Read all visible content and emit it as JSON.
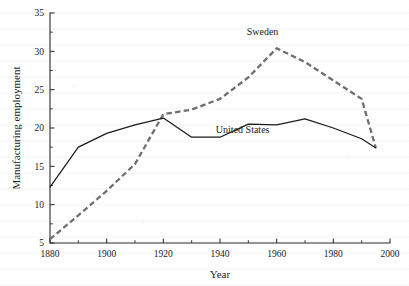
{
  "figure": {
    "name": "manufacturing-employment-line-chart",
    "background_color": "#fefefe"
  },
  "chart_data": {
    "type": "line",
    "title": "",
    "subtitle": "",
    "xlabel": "Year",
    "ylabel": "Manufacturing employment",
    "xlim": [
      1880,
      2000
    ],
    "ylim": [
      5,
      35
    ],
    "xticks": [
      1880,
      1900,
      1920,
      1940,
      1960,
      1980,
      2000
    ],
    "xticklabels": [
      "1880",
      "1900",
      "1920",
      "1940",
      "1960",
      "1980",
      "2000"
    ],
    "xticks_minor": [
      1890,
      1910,
      1930,
      1950,
      1970,
      1990
    ],
    "yticks": [
      5,
      10,
      15,
      20,
      25,
      30,
      35
    ],
    "yticklabels": [
      "5",
      "10",
      "15",
      "20",
      "25",
      "30",
      "35"
    ],
    "yticks_minor": [
      7.5,
      12.5,
      17.5,
      22.5,
      27.5,
      32.5
    ],
    "grid": false,
    "legend_position": "inline-annotations",
    "series": [
      {
        "name": "Sweden",
        "style": "dashed",
        "color": "#6f6f6f",
        "label_x": 1955,
        "label_y": 32.1,
        "x": [
          1880,
          1890,
          1900,
          1910,
          1920,
          1930,
          1940,
          1950,
          1960,
          1970,
          1980,
          1990,
          1995
        ],
        "y": [
          5.5,
          8.6,
          11.8,
          15.3,
          21.8,
          22.4,
          23.8,
          26.6,
          30.4,
          28.6,
          26.2,
          23.8,
          17.4
        ]
      },
      {
        "name": "United States",
        "style": "solid",
        "color": "#1c1c1c",
        "label_x": 1948,
        "label_y": 19.3,
        "x": [
          1880,
          1890,
          1900,
          1910,
          1920,
          1930,
          1940,
          1950,
          1960,
          1970,
          1980,
          1990,
          1995
        ],
        "y": [
          12.3,
          17.5,
          19.3,
          20.4,
          21.3,
          18.8,
          18.8,
          20.5,
          20.4,
          21.2,
          20.0,
          18.6,
          17.4
        ]
      }
    ],
    "annotations": [
      {
        "text": "Sweden",
        "x": 1955,
        "y": 32.1
      },
      {
        "text": "United States",
        "x": 1948,
        "y": 19.3
      }
    ]
  }
}
